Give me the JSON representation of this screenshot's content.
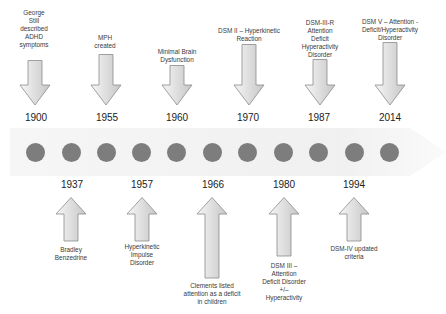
{
  "colors": {
    "dot": "#7d7d7d",
    "band": "#f1f1f1",
    "arrow_fill_light": "#f4f4f4",
    "arrow_fill_dark": "#c9c9c9",
    "arrow_stroke": "#8a8a8a"
  },
  "top_events": [
    {
      "year": "1900",
      "label": "George Still described ADHD symptoms",
      "lines": [
        "George",
        "Still",
        "described",
        "ADHD",
        "symptoms"
      ]
    },
    {
      "year": "1955",
      "label": "MPH created",
      "lines": [
        "MPH",
        "created"
      ]
    },
    {
      "year": "1960",
      "label": "Minimal Brain Dysfunction",
      "lines": [
        "Minimal Brain",
        "Dysfunction"
      ]
    },
    {
      "year": "1970",
      "label": "DSM II – Hyperkinetic Reaction",
      "lines": [
        "DSM II – Hyperkinetic",
        "Reaction"
      ]
    },
    {
      "year": "1987",
      "label": "DSM-III-R Attention Deficit Hyperactivity Disorder",
      "lines": [
        "DSM-III-R",
        "Attention",
        "Deficit",
        "Hyperactivity",
        "Disorder"
      ]
    },
    {
      "year": "2014",
      "label": "DSM V – Attention - Deficit/Hyperactivity Disorder",
      "lines": [
        "DSM V – Attention -",
        "Deficit/Hyperactivity",
        "Disorder"
      ]
    }
  ],
  "bottom_events": [
    {
      "year": "1937",
      "label": "Bradley Benzedrine",
      "lines": [
        "Bradley",
        "Benzedrine"
      ]
    },
    {
      "year": "1957",
      "label": "Hyperkinetic Impulse Disorder",
      "lines": [
        "Hyperkinetic",
        "Impulse",
        "Disorder"
      ]
    },
    {
      "year": "1966",
      "label": "Clements listed attention as a deficit in children",
      "lines": [
        "Clements listed",
        "attention as a deficit",
        "in children"
      ]
    },
    {
      "year": "1980",
      "label": "DSM III – Attention Deficit Disorder +/– Hyperactivity",
      "lines": [
        "DSM III –",
        "Attention",
        "Deficit Disorder",
        "+/–",
        "Hyperactivity"
      ]
    },
    {
      "year": "1994",
      "label": "DSM-IV updated criteria",
      "lines": [
        "DSM-IV updated",
        "criteria"
      ]
    }
  ],
  "dot_count": 11
}
